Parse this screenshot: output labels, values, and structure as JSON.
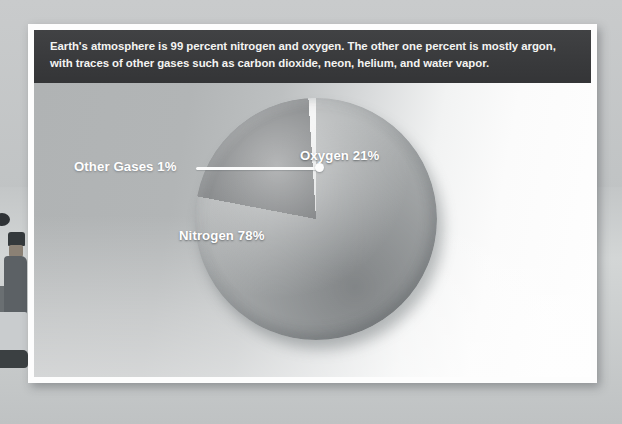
{
  "caption": {
    "text": "Earth's atmosphere is 99 percent nitrogen and oxygen. The other one percent is mostly argon, with traces of other gases such as carbon dioxide, neon, helium, and water vapor."
  },
  "labels": {
    "oxygen": "Oxygen 21%",
    "nitrogen": "Nitrogen 78%",
    "other_gases": "Other Gases 1%"
  },
  "colors": {
    "caption_bar": "#3a3b3d",
    "nitrogen": "#adb0b1",
    "oxygen": "#6e7173",
    "other_gases": "#f2f3f3",
    "panel": "#fdfdfd",
    "label_text": "#ffffff"
  },
  "chart_data": {
    "type": "pie",
    "categories": [
      "Nitrogen",
      "Oxygen",
      "Other Gases"
    ],
    "values": [
      78,
      21,
      1
    ],
    "unit": "percent",
    "data_labels": [
      "Nitrogen 78%",
      "Oxygen 21%",
      "Other Gases 1%"
    ],
    "slice_colors": [
      "#adb0b1",
      "#6e7173",
      "#f2f3f3"
    ],
    "start_angle_deg": 0,
    "direction": "clockwise",
    "legend": "none",
    "grid": false,
    "annotations": [
      {
        "text": "Other Gases 1%",
        "target_slice": "Other Gases",
        "style": "leader-line-with-dot"
      }
    ],
    "xlabel": "",
    "ylabel": ""
  }
}
